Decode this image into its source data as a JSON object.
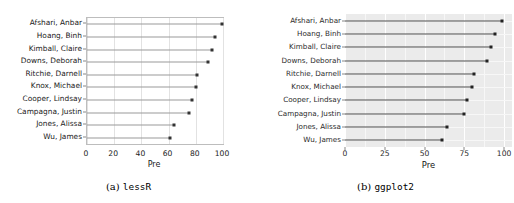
{
  "figure": {
    "panels": [
      {
        "id": "lessR",
        "caption_label": "(a)",
        "caption_name": "lessR"
      },
      {
        "id": "ggplot2",
        "caption_label": "(b)",
        "caption_name": "ggplot2"
      }
    ]
  },
  "chart_data": [
    {
      "type": "bar",
      "subtype": "lollipop-horizontal",
      "title": "",
      "xlabel": "Pre",
      "ylabel": "",
      "categories": [
        "Afshari, Anbar",
        "Hoang, Binh",
        "Kimball, Claire",
        "Downs, Deborah",
        "Ritchie, Darnell",
        "Knox, Michael",
        "Cooper, Lindsay",
        "Campagna, Justin",
        "Jones, Alissa",
        "Wu, James"
      ],
      "values": [
        99,
        94,
        92,
        89,
        81,
        80,
        77,
        75,
        64,
        61
      ],
      "xlim": [
        0,
        100
      ],
      "xticks": [
        0,
        20,
        40,
        60,
        80,
        100
      ],
      "grid": true,
      "grid_orientation": "vertical",
      "panel_background": "#ffffff",
      "line_color": "#9a9a9a",
      "point_color": "#333333",
      "legend": "none"
    },
    {
      "type": "bar",
      "subtype": "lollipop-horizontal",
      "title": "",
      "xlabel": "Pre",
      "ylabel": "",
      "categories": [
        "Afshari, Anbar",
        "Hoang, Binh",
        "Kimball, Claire",
        "Downs, Deborah",
        "Ritchie, Darnell",
        "Knox, Michael",
        "Cooper, Lindsay",
        "Campagna, Justin",
        "Jones, Alissa",
        "Wu, James"
      ],
      "values": [
        99,
        94,
        92,
        89,
        81,
        80,
        77,
        75,
        64,
        61
      ],
      "xlim": [
        0,
        105
      ],
      "xticks": [
        0,
        25,
        50,
        75,
        100
      ],
      "xticks_minor": [
        12.5,
        37.5,
        62.5,
        87.5
      ],
      "grid": true,
      "grid_orientation": "both",
      "panel_background": "#ebebeb",
      "gridline_major_color": "#ffffff",
      "gridline_minor_color": "#f7f7f7",
      "line_color": "#4d4d4d",
      "point_color": "#222222",
      "legend": "none"
    }
  ]
}
